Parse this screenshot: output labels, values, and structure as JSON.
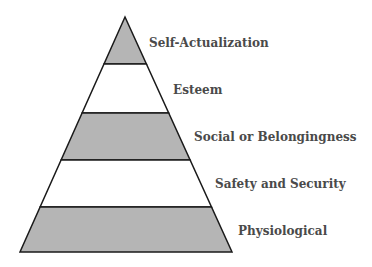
{
  "diagram": {
    "type": "pyramid",
    "colors": {
      "shaded": "#b5b5b5",
      "unshaded": "#ffffff",
      "outline": "#1a1a1a",
      "text": "#4a4a4a"
    },
    "levels": [
      {
        "label": "Self-Actualization",
        "shaded": true
      },
      {
        "label": "Esteem",
        "shaded": false
      },
      {
        "label": "Social or Belongingness",
        "shaded": true
      },
      {
        "label": "Safety and Security",
        "shaded": false
      },
      {
        "label": "Physiological",
        "shaded": true
      }
    ]
  }
}
